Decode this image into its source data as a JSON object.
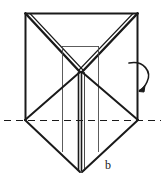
{
  "figure": {
    "caption_label": "b",
    "stroke_color": "#1a1a1a",
    "thin_stroke_color": "#4a4a4a",
    "background_color": "#ffffff"
  },
  "geometry": {
    "outer_frame": {
      "name": "outer-rectangle",
      "top_left": [
        25,
        13
      ],
      "top_right": [
        138,
        13
      ],
      "bottom_left": [
        25,
        120
      ],
      "bottom_right": [
        138,
        120
      ]
    },
    "center_vertex": [
      81,
      72
    ],
    "bottom_vertex": [
      81,
      172
    ],
    "left_vertex": [
      25,
      120
    ],
    "right_vertex": [
      138,
      120
    ],
    "inner_panel": {
      "name": "inner-rectangle",
      "top_y": 46,
      "left_x": 62,
      "right_x": 99,
      "bottom_y": 170
    },
    "dashed_axis": {
      "name": "fold-axis",
      "y": 120,
      "x_start": 4,
      "x_end": 161,
      "dash_pattern": "7 5"
    },
    "rotation_arrow": {
      "name": "rotation-arrow",
      "start": [
        131,
        63
      ],
      "end": [
        139,
        90
      ],
      "direction": "clockwise-down"
    }
  },
  "annotations": {
    "b_label": {
      "text": "b",
      "x": 105,
      "y": 159
    }
  }
}
